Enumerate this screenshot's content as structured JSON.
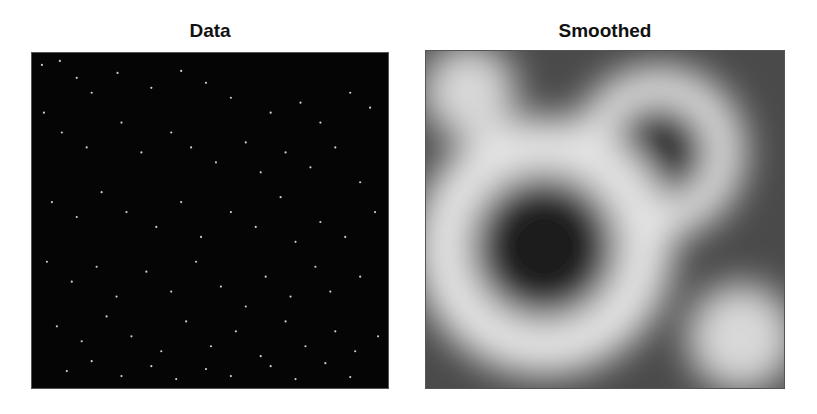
{
  "figure": {
    "panels": [
      {
        "title": "Data"
      },
      {
        "title": "Smoothed"
      }
    ]
  },
  "chart_data": [
    {
      "type": "heatmap",
      "title": "Data",
      "description": "Sparse point events on a black background (binary/grayscale image of scattered points)",
      "xlabel": "",
      "ylabel": "",
      "grid": false,
      "colormap": "gray",
      "background": "#050505",
      "points_px": [
        [
          10,
          12
        ],
        [
          28,
          8
        ],
        [
          45,
          25
        ],
        [
          60,
          40
        ],
        [
          86,
          20
        ],
        [
          120,
          35
        ],
        [
          150,
          18
        ],
        [
          175,
          30
        ],
        [
          200,
          45
        ],
        [
          240,
          60
        ],
        [
          270,
          50
        ],
        [
          290,
          70
        ],
        [
          320,
          40
        ],
        [
          340,
          55
        ],
        [
          12,
          60
        ],
        [
          30,
          80
        ],
        [
          55,
          95
        ],
        [
          90,
          70
        ],
        [
          110,
          100
        ],
        [
          140,
          80
        ],
        [
          160,
          95
        ],
        [
          185,
          110
        ],
        [
          215,
          90
        ],
        [
          230,
          120
        ],
        [
          255,
          100
        ],
        [
          280,
          115
        ],
        [
          305,
          95
        ],
        [
          330,
          130
        ],
        [
          20,
          150
        ],
        [
          45,
          165
        ],
        [
          70,
          140
        ],
        [
          95,
          160
        ],
        [
          125,
          175
        ],
        [
          150,
          150
        ],
        [
          170,
          185
        ],
        [
          200,
          160
        ],
        [
          225,
          175
        ],
        [
          250,
          145
        ],
        [
          265,
          190
        ],
        [
          290,
          170
        ],
        [
          315,
          185
        ],
        [
          345,
          160
        ],
        [
          15,
          210
        ],
        [
          40,
          230
        ],
        [
          65,
          215
        ],
        [
          85,
          245
        ],
        [
          115,
          220
        ],
        [
          140,
          240
        ],
        [
          165,
          210
        ],
        [
          190,
          235
        ],
        [
          215,
          255
        ],
        [
          235,
          225
        ],
        [
          260,
          245
        ],
        [
          285,
          215
        ],
        [
          300,
          240
        ],
        [
          330,
          225
        ],
        [
          25,
          275
        ],
        [
          50,
          290
        ],
        [
          75,
          265
        ],
        [
          100,
          285
        ],
        [
          130,
          300
        ],
        [
          155,
          270
        ],
        [
          180,
          295
        ],
        [
          205,
          280
        ],
        [
          230,
          305
        ],
        [
          255,
          270
        ],
        [
          275,
          295
        ],
        [
          305,
          280
        ],
        [
          325,
          300
        ],
        [
          348,
          285
        ],
        [
          35,
          320
        ],
        [
          60,
          310
        ],
        [
          90,
          325
        ],
        [
          120,
          315
        ],
        [
          145,
          328
        ],
        [
          175,
          318
        ],
        [
          200,
          325
        ],
        [
          240,
          315
        ],
        [
          265,
          328
        ],
        [
          295,
          312
        ],
        [
          320,
          326
        ]
      ]
    },
    {
      "type": "heatmap",
      "title": "Smoothed",
      "description": "Gaussian-smoothed density of the data; bright ring structures with dark interiors",
      "xlabel": "",
      "ylabel": "",
      "grid": false,
      "colormap": "gray",
      "features": [
        {
          "kind": "bright_blob",
          "cx_frac": 0.12,
          "cy_frac": 0.12,
          "r_frac": 0.14
        },
        {
          "kind": "bright_peak",
          "cx_frac": 0.52,
          "cy_frac": 0.38,
          "r_frac": 0.1
        },
        {
          "kind": "ring",
          "cx_frac": 0.65,
          "cy_frac": 0.3,
          "r_frac": 0.2,
          "center": "dark"
        },
        {
          "kind": "ring",
          "cx_frac": 0.33,
          "cy_frac": 0.58,
          "r_frac": 0.3,
          "center": "dark"
        },
        {
          "kind": "bright_blob",
          "cx_frac": 0.88,
          "cy_frac": 0.85,
          "r_frac": 0.16,
          "center": "mid-gray"
        }
      ]
    }
  ]
}
